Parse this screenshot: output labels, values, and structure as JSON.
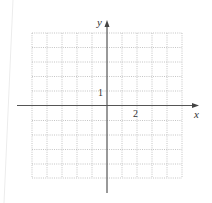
{
  "diagram": {
    "type": "coordinate-grid",
    "axes": {
      "x_label": "x",
      "y_label": "y",
      "x_tick_label": "2",
      "y_tick_label": "1"
    },
    "grid": {
      "columns": 10,
      "rows": 10,
      "x_range": [
        -5,
        5
      ],
      "y_range": [
        -5,
        5
      ],
      "style": "dotted"
    },
    "colors": {
      "axis": "#555555",
      "grid": "#b5b5b5",
      "text": "#333333"
    }
  }
}
